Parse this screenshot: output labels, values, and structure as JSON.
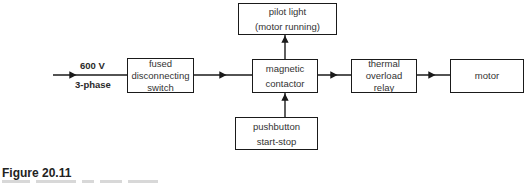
{
  "diagram": {
    "input": {
      "voltage": "600 V",
      "phase": "3-phase"
    },
    "blocks": {
      "fused_switch": {
        "line1": "fused",
        "line2": "disconnecting",
        "line3": "switch"
      },
      "pilot_light": {
        "line1": "pilot light",
        "line2": "(motor running)"
      },
      "magnetic_contactor": {
        "line1": "magnetic",
        "line2": "contactor"
      },
      "pushbutton": {
        "line1": "pushbutton",
        "line2": "start-stop"
      },
      "thermal_relay": {
        "line1": "thermal",
        "line2": "overload",
        "line3": "relay"
      },
      "motor": {
        "line1": "motor"
      }
    },
    "connections": [
      {
        "from": "input",
        "to": "fused_switch"
      },
      {
        "from": "fused_switch",
        "to": "magnetic_contactor"
      },
      {
        "from": "magnetic_contactor",
        "to": "pilot_light"
      },
      {
        "from": "pushbutton",
        "to": "magnetic_contactor"
      },
      {
        "from": "magnetic_contactor",
        "to": "thermal_relay"
      },
      {
        "from": "thermal_relay",
        "to": "motor"
      }
    ]
  },
  "caption": {
    "title": "Figure 20.11"
  }
}
